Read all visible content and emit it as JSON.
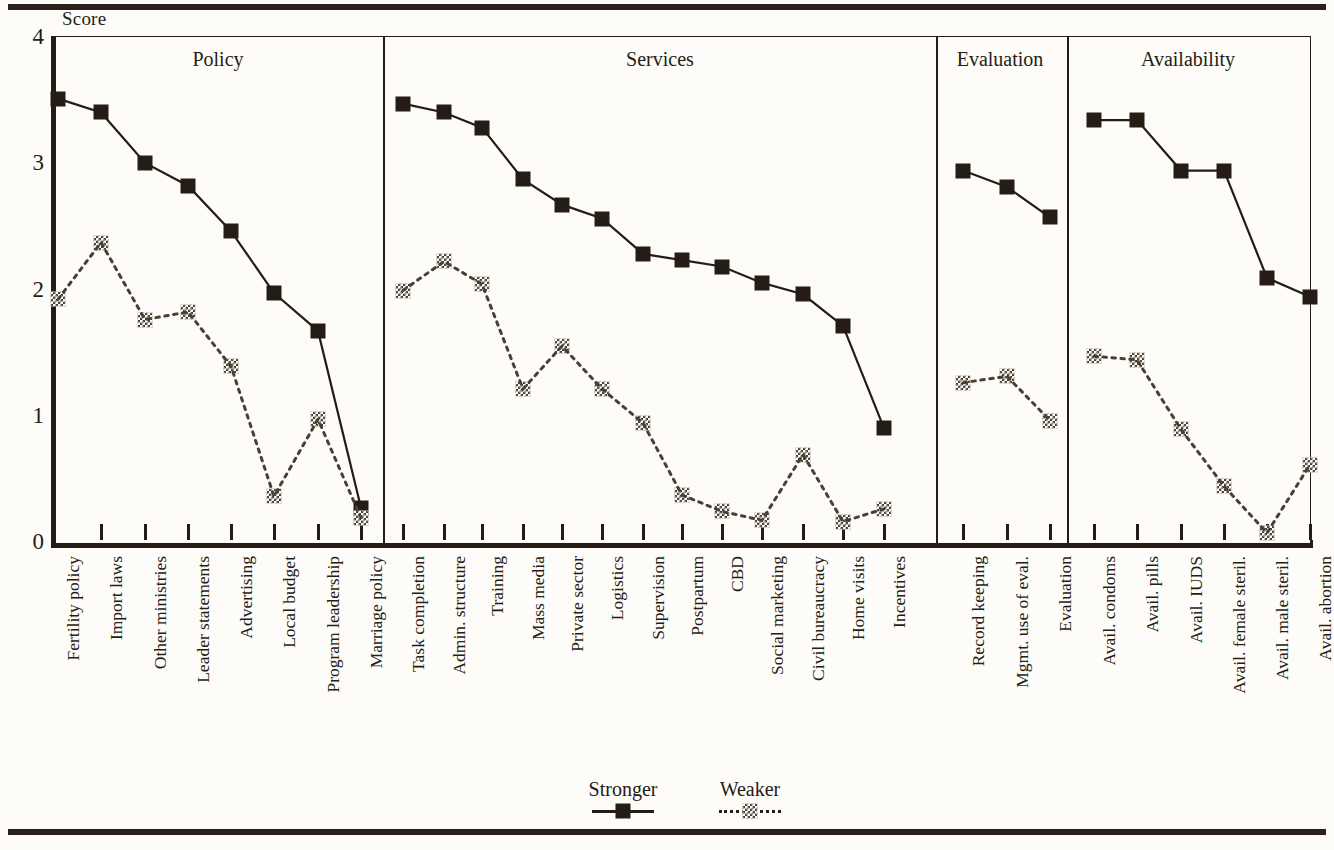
{
  "axis": {
    "y_title": "Score",
    "y_ticks": [
      "4",
      "3",
      "2",
      "1",
      "0"
    ],
    "y_min": 0,
    "y_max": 4
  },
  "groups": [
    {
      "title": "Policy"
    },
    {
      "title": "Services"
    },
    {
      "title": "Evaluation"
    },
    {
      "title": "Availability"
    }
  ],
  "legend": {
    "stronger_label": "Stronger",
    "weaker_label": "Weaker"
  },
  "chart_data": {
    "type": "line",
    "title": "",
    "xlabel": "",
    "ylabel": "Score",
    "ylim": [
      0,
      4
    ],
    "yticks": [
      0,
      1,
      2,
      3,
      4
    ],
    "grid": false,
    "legend_position": "bottom-center",
    "groups": [
      {
        "name": "Policy",
        "categories": [
          "Fertility policy",
          "Import laws",
          "Other ministries",
          "Leader statements",
          "Advertising",
          "Local budget",
          "Program leadership",
          "Marriage policy"
        ]
      },
      {
        "name": "Services",
        "categories": [
          "Task completion",
          "Admin. structure",
          "Training",
          "Mass media",
          "Private sector",
          "Logistics",
          "Supervision",
          "Postpartum",
          "CBD",
          "Social marketing",
          "Civil bureaucracy",
          "Home visits",
          "Incentives"
        ]
      },
      {
        "name": "Evaluation",
        "categories": [
          "Record keeping",
          "Mgmt. use of eval.",
          "Evaluation"
        ]
      },
      {
        "name": "Availability",
        "categories": [
          "Avail. condoms",
          "Avail. pills",
          "Avail. IUDS",
          "Avail. female steril.",
          "Avail. male steril.",
          "Avail. abortion"
        ]
      }
    ],
    "categories": [
      "Fertility policy",
      "Import laws",
      "Other ministries",
      "Leader statements",
      "Advertising",
      "Local budget",
      "Program leadership",
      "Marriage policy",
      "Task completion",
      "Admin. structure",
      "Training",
      "Mass media",
      "Private sector",
      "Logistics",
      "Supervision",
      "Postpartum",
      "CBD",
      "Social marketing",
      "Civil bureaucracy",
      "Home visits",
      "Incentives",
      "Record keeping",
      "Mgmt. use of eval.",
      "Evaluation",
      "Avail. condoms",
      "Avail. pills",
      "Avail. IUDS",
      "Avail. female steril.",
      "Avail. male steril.",
      "Avail. abortion"
    ],
    "series": [
      {
        "name": "Stronger",
        "marker": "filled-square",
        "line": "solid",
        "color": "#241c15",
        "values_by_group": [
          [
            3.52,
            3.41,
            3.01,
            2.83,
            2.47,
            1.98,
            1.68,
            0.28
          ],
          [
            3.48,
            3.41,
            3.29,
            2.88,
            2.68,
            2.57,
            2.29,
            2.24,
            2.19,
            2.06,
            1.97,
            1.72,
            0.91
          ],
          [
            2.95,
            2.82,
            2.58
          ],
          [
            3.35,
            3.35,
            2.95,
            2.95,
            2.1,
            1.95
          ]
        ]
      },
      {
        "name": "Weaker",
        "marker": "checkered-square",
        "line": "dotted",
        "color": "#4a3f34",
        "values_by_group": [
          [
            1.93,
            2.38,
            1.77,
            1.83,
            1.4,
            0.37,
            0.98,
            0.2
          ],
          [
            2.0,
            2.23,
            2.05,
            1.22,
            1.56,
            1.22,
            0.95,
            0.38,
            0.25,
            0.18,
            0.7,
            0.17,
            0.27
          ],
          [
            1.27,
            1.32,
            0.97
          ],
          [
            1.48,
            1.45,
            0.9,
            0.45,
            0.08,
            0.62
          ]
        ]
      }
    ]
  }
}
